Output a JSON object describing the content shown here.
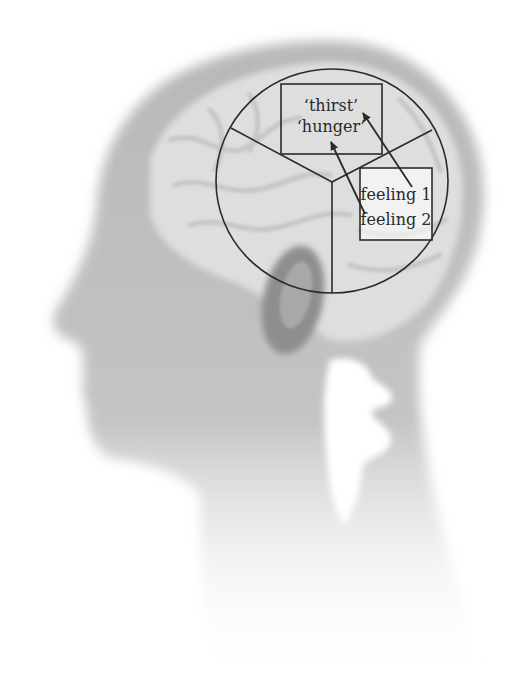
{
  "diagram": {
    "circle_sections": 3,
    "top_box": {
      "lines": [
        "‘thirst’",
        "‘hunger’"
      ]
    },
    "side_box": {
      "lines": [
        "feeling 1",
        "feeling 2"
      ]
    },
    "arrows": [
      {
        "from": "feeling 1",
        "to": "‘thirst’"
      },
      {
        "from": "feeling 2",
        "to": "‘hunger’"
      }
    ],
    "colors": {
      "background": "#ffffff",
      "head": "#bdbdbd",
      "brain": "#e2e2e2",
      "ear": "#8c8c8c",
      "line": "#2a2a2a"
    }
  }
}
